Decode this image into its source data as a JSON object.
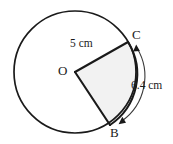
{
  "figure": {
    "type": "circle-sector-geometry-diagram",
    "background_color": "#ffffff",
    "stroke_color": "#1a1a1a",
    "sector_fill_color": "#f2f2f2",
    "circle": {
      "center_label": "O",
      "center_x": 75,
      "center_y": 72,
      "radius_px": 61
    },
    "points": [
      {
        "name": "center-point-o",
        "label": "O",
        "x": 75,
        "y": 72
      },
      {
        "name": "arc-endpoint-c",
        "label": "C",
        "x": 128,
        "y": 42
      },
      {
        "name": "arc-endpoint-b",
        "label": "B",
        "x": 110,
        "y": 125
      }
    ],
    "measurements": [
      {
        "name": "radius-measurement",
        "label": "5 cm",
        "value": 5,
        "unit": "cm",
        "applies_to": "radius OC"
      },
      {
        "name": "arc-length-measurement",
        "label": "6.4 cm",
        "value": 6.4,
        "unit": "cm",
        "applies_to": "arc BC"
      }
    ],
    "annotations": {
      "arc_arrow": "double-headed-curved-arrow",
      "arc_arrow_from": "B",
      "arc_arrow_to": "C"
    }
  }
}
